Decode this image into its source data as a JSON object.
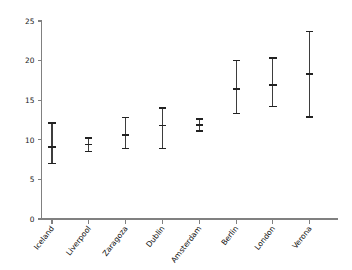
{
  "chart_data": {
    "type": "scatter",
    "title": "",
    "subtitle": "",
    "xlabel": "",
    "ylabel": "",
    "grid": false,
    "legend": "none",
    "categories": [
      "Iceland",
      "Liverpool",
      "Zaragoza",
      "Dublin",
      "Amsterdam",
      "Berlin",
      "London",
      "Verona"
    ],
    "values": [
      9.1,
      9.4,
      10.6,
      11.8,
      11.9,
      16.4,
      16.9,
      18.3
    ],
    "error_low": [
      7.0,
      8.5,
      8.9,
      8.9,
      11.1,
      13.3,
      14.2,
      12.9
    ],
    "error_high": [
      12.1,
      10.2,
      12.8,
      14.0,
      12.6,
      20.0,
      20.3,
      23.7
    ],
    "series": [
      {
        "name": "estimate",
        "points": [
          {
            "category": "Iceland",
            "value": 9.1,
            "low": 7.0,
            "high": 12.1
          },
          {
            "category": "Liverpool",
            "value": 9.4,
            "low": 8.5,
            "high": 10.2
          },
          {
            "category": "Zaragoza",
            "value": 10.6,
            "low": 8.9,
            "high": 12.8
          },
          {
            "category": "Dublin",
            "value": 11.8,
            "low": 8.9,
            "high": 14.0
          },
          {
            "category": "Amsterdam",
            "value": 11.9,
            "low": 11.1,
            "high": 12.6
          },
          {
            "category": "Berlin",
            "value": 16.4,
            "low": 13.3,
            "high": 20.0
          },
          {
            "category": "London",
            "value": 16.9,
            "low": 14.2,
            "high": 20.3
          },
          {
            "category": "Verona",
            "value": 18.3,
            "low": 12.9,
            "high": 23.7
          }
        ]
      }
    ],
    "ylim": [
      0,
      25
    ],
    "yticks": [
      0,
      5,
      10,
      15,
      20,
      25
    ],
    "ytick_labels": [
      "0",
      "5",
      "10",
      "15",
      "20",
      "25"
    ],
    "xtick_labels": [
      "Iceland",
      "Liverpool",
      "Zaragoza",
      "Dublin",
      "Amsterdam",
      "Berlin",
      "London",
      "Verona"
    ],
    "annotations": [],
    "colors": {
      "axis": "#808080",
      "marker": "#222222",
      "bar": "#3d3d3d",
      "background": "#ffffff",
      "text": "#111111"
    }
  }
}
